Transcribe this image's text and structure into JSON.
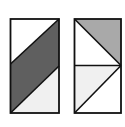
{
  "diagram": {
    "colors": {
      "background": "#ffffff",
      "stroke": "#111111",
      "dark_gray": "#5f5f5f",
      "medium_gray": "#a9a9a9",
      "light_gray": "#f0f0f0",
      "white": "#ffffff"
    },
    "figures": [
      {
        "name": "left-rectangle",
        "regions": [
          "white-top-left-triangle",
          "dark-gray-parallelogram",
          "light-gray-bottom-right-triangle"
        ]
      },
      {
        "name": "right-rectangle",
        "regions": [
          "medium-gray-top-right-triangle",
          "white-top-left-triangle",
          "light-gray-bottom-left-triangle",
          "white-bottom-right-triangle"
        ]
      }
    ]
  }
}
